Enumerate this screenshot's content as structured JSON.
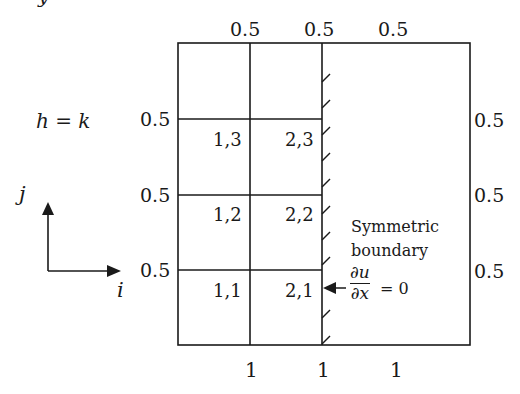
{
  "diagram": {
    "title_partial": "y",
    "spacing_label": "h = k",
    "axes": {
      "i_label": "i",
      "j_label": "j"
    },
    "top_spacings": [
      "0.5",
      "0.5",
      "0.5"
    ],
    "left_spacings": [
      "0.5",
      "0.5",
      "0.5"
    ],
    "right_spacings": [
      "0.5",
      "0.5",
      "0.5"
    ],
    "bottom_spacings": [
      "1",
      "1",
      "1"
    ],
    "nodes": [
      {
        "label": "1,3"
      },
      {
        "label": "2,3"
      },
      {
        "label": "1,2"
      },
      {
        "label": "2,2"
      },
      {
        "label": "1,1"
      },
      {
        "label": "2,1"
      }
    ],
    "boundary": {
      "line1": "Symmetric",
      "line2": "boundary",
      "numerator": "∂u",
      "denominator": "∂x",
      "equals": "= 0"
    },
    "colors": {
      "line": "#1a1a1a",
      "background": "#ffffff"
    }
  }
}
